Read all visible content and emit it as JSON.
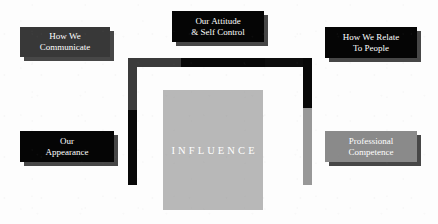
{
  "diagram": {
    "background_color": "#fdfdfd",
    "center": {
      "label": "INFLUENCE",
      "fill_color": "#b8b8b8",
      "text_color": "#ffffff",
      "x": 163,
      "y": 90,
      "width": 100,
      "height": 120
    },
    "nodes": [
      {
        "id": "how-we-communicate",
        "label": "How We\nCommunicate",
        "fill_color": "#383838",
        "text_color": "#ffffff",
        "x": 20,
        "y": 27,
        "width": 90,
        "height": 30,
        "position": "top-left"
      },
      {
        "id": "our-attitude-self-control",
        "label": "Our Attitude\n& Self Control",
        "fill_color": "#050505",
        "text_color": "#ffffff",
        "x": 172,
        "y": 11,
        "width": 92,
        "height": 31,
        "position": "top-center"
      },
      {
        "id": "how-we-relate-to-people",
        "label": "How We Relate\nTo People",
        "fill_color": "#050505",
        "text_color": "#ffffff",
        "x": 325,
        "y": 27,
        "width": 92,
        "height": 31,
        "position": "top-right"
      },
      {
        "id": "our-appearance",
        "label": "Our\nAppearance",
        "fill_color": "#050505",
        "text_color": "#ffffff",
        "x": 20,
        "y": 131,
        "width": 94,
        "height": 31,
        "position": "bottom-left"
      },
      {
        "id": "professional-competence",
        "label": "Professional\nCompetence",
        "fill_color": "#8a8a8a",
        "text_color": "#ffffff",
        "x": 325,
        "y": 131,
        "width": 92,
        "height": 31,
        "position": "bottom-right"
      }
    ],
    "connector": {
      "description": "inverted-U bracket linking the four outer nodes to the central influence block",
      "segments": [
        {
          "id": "left-vertical-upper",
          "color": "#3b3b3b",
          "x": 128,
          "y": 58,
          "width": 9,
          "height": 52
        },
        {
          "id": "left-vertical-lower",
          "color": "#080808",
          "x": 128,
          "y": 110,
          "width": 9,
          "height": 75
        },
        {
          "id": "top-horizontal-left",
          "color": "#3b3b3b",
          "x": 128,
          "y": 58,
          "width": 53,
          "height": 9
        },
        {
          "id": "top-horizontal-mid",
          "color": "#080808",
          "x": 181,
          "y": 58,
          "width": 84,
          "height": 9
        },
        {
          "id": "top-horizontal-right",
          "color": "#0d0d0d",
          "x": 265,
          "y": 58,
          "width": 47,
          "height": 9
        },
        {
          "id": "right-vertical-upper",
          "color": "#080808",
          "x": 303,
          "y": 58,
          "width": 9,
          "height": 50
        },
        {
          "id": "right-vertical-lower",
          "color": "#989898",
          "x": 303,
          "y": 108,
          "width": 9,
          "height": 77
        }
      ]
    }
  }
}
